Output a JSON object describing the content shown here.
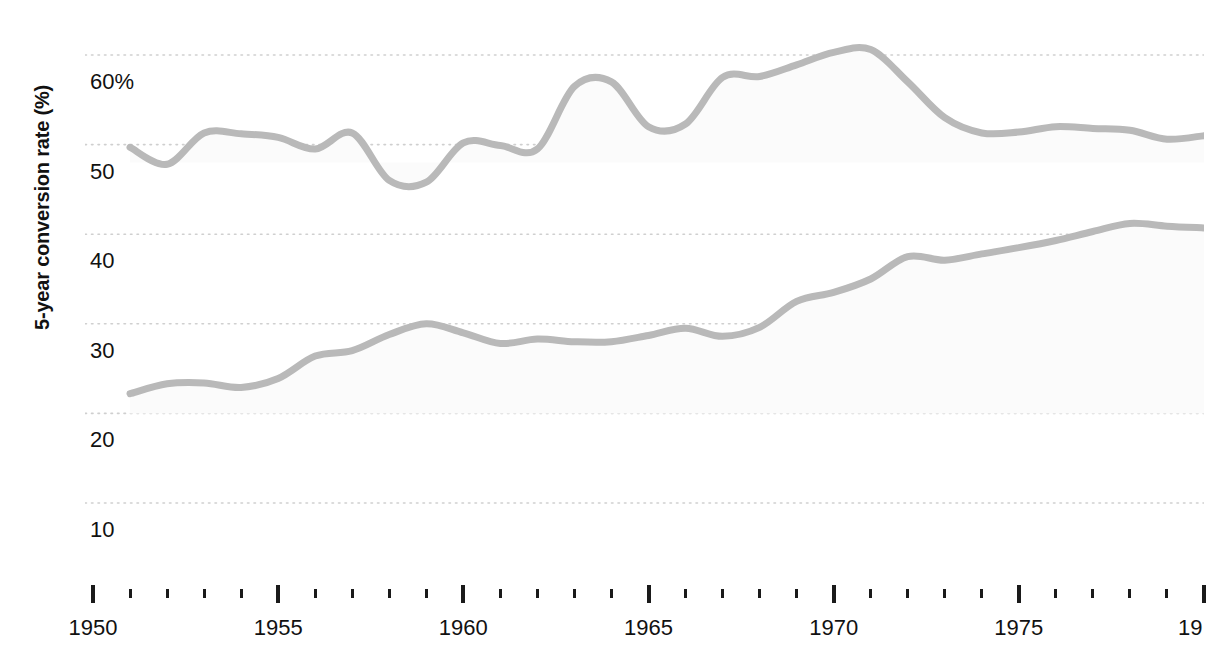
{
  "chart_data": {
    "type": "line",
    "title": "",
    "xlabel": "",
    "ylabel": "5-year conversion rate (%)",
    "xlim": [
      1950,
      1980
    ],
    "ylim": [
      5,
      63
    ],
    "grid": true,
    "gridlines_y": [
      60,
      50,
      40,
      30,
      20,
      10
    ],
    "legend": "none",
    "y_ticklabels": [
      "60%",
      "50",
      "40",
      "30",
      "20",
      "10"
    ],
    "y_tickvalues": [
      60,
      50,
      40,
      30,
      20,
      10
    ],
    "x_ticklabels": [
      "1950",
      "1955",
      "1960",
      "1965",
      "1970",
      "1975",
      "19"
    ],
    "x_tickvalues": [
      1950,
      1955,
      1960,
      1965,
      1970,
      1975,
      1980
    ],
    "x_minor_step": 1,
    "line_color": "#b9b9b9",
    "fill_color": "#fbfbfb",
    "axis_text_color": "#111111",
    "gridline_color": "#cfcfcf",
    "x": [
      1951,
      1952,
      1953,
      1954,
      1955,
      1956,
      1957,
      1958,
      1959,
      1960,
      1961,
      1962,
      1963,
      1964,
      1965,
      1966,
      1967,
      1968,
      1969,
      1970,
      1971,
      1972,
      1973,
      1974,
      1975,
      1976,
      1977,
      1978,
      1979,
      1980
    ],
    "series": [
      {
        "name": "upper",
        "values": [
          49.7,
          47.8,
          51.3,
          51.2,
          50.8,
          49.5,
          51.3,
          46.0,
          45.8,
          50.2,
          49.9,
          49.5,
          56.5,
          57.0,
          52.0,
          52.3,
          57.5,
          57.6,
          58.9,
          60.3,
          60.6,
          57.0,
          53.0,
          51.3,
          51.4,
          52.0,
          51.8,
          51.6,
          50.6,
          51.0
        ]
      },
      {
        "name": "lower",
        "values": [
          22.2,
          23.3,
          23.4,
          22.9,
          23.9,
          26.4,
          27.0,
          28.8,
          30.0,
          29.0,
          27.8,
          28.3,
          28.0,
          28.0,
          28.7,
          29.5,
          28.6,
          29.6,
          32.5,
          33.5,
          35.0,
          37.5,
          37.1,
          37.8,
          38.5,
          39.3,
          40.3,
          41.2,
          40.9,
          40.7
        ]
      }
    ]
  }
}
